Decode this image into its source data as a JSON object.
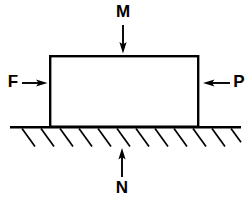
{
  "diagram": {
    "background_color": "#ffffff",
    "line_color": "#000000",
    "block": {
      "name": "block",
      "fill_color": "#ffffff",
      "x": 49,
      "y": 55,
      "width": 150,
      "height": 72
    },
    "ground": {
      "name": "ground-surface",
      "x_start": 10,
      "x_end": 241,
      "y": 127,
      "hatch_count": 12,
      "hatch_start_x": 22,
      "hatch_spacing": 19,
      "hatch_dx": 13,
      "hatch_dy": 18
    },
    "forces": [
      {
        "id": "M",
        "label": "M",
        "direction": "down",
        "label_x": 123,
        "label_y": 13,
        "shaft_x1": 123,
        "shaft_y1": 25,
        "shaft_x2": 123,
        "shaft_y2": 47,
        "tip_x": 123,
        "tip_y": 53
      },
      {
        "id": "F",
        "label": "F",
        "direction": "right",
        "label_x": 14,
        "label_y": 83,
        "shaft_x1": 22,
        "shaft_y1": 83,
        "shaft_x2": 41,
        "shaft_y2": 83,
        "tip_x": 47,
        "tip_y": 83
      },
      {
        "id": "P",
        "label": "P",
        "direction": "left",
        "label_x": 238,
        "label_y": 83,
        "shaft_x1": 230,
        "shaft_y1": 83,
        "shaft_x2": 210,
        "shaft_y2": 83,
        "tip_x": 203,
        "tip_y": 83
      },
      {
        "id": "N",
        "label": "N",
        "direction": "up",
        "label_x": 122,
        "label_y": 189,
        "shaft_x1": 122,
        "shaft_y1": 177,
        "shaft_x2": 122,
        "shaft_y2": 155,
        "tip_x": 122,
        "tip_y": 148
      }
    ]
  }
}
